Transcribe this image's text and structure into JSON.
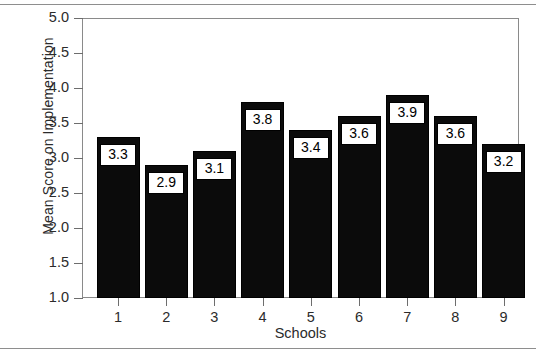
{
  "chart_data": {
    "type": "bar",
    "title": "",
    "xlabel": "Schools",
    "ylabel": "Mean Score on Implementation",
    "categories": [
      "1",
      "2",
      "3",
      "4",
      "5",
      "6",
      "7",
      "8",
      "9"
    ],
    "values": [
      3.3,
      2.9,
      3.1,
      3.8,
      3.4,
      3.6,
      3.9,
      3.6,
      3.2
    ],
    "value_labels": [
      "3.3",
      "2.9",
      "3.1",
      "3.8",
      "3.4",
      "3.6",
      "3.9",
      "3.6",
      "3.2"
    ],
    "ylim": [
      1.0,
      5.0
    ],
    "ytick_labels": [
      "5.0",
      "4.5",
      "4.0",
      "3.5",
      "3.0",
      "2.5",
      "2.0",
      "1.5",
      "1.0"
    ],
    "ytick_values": [
      5.0,
      4.5,
      4.0,
      3.5,
      3.0,
      2.5,
      2.0,
      1.5,
      1.0
    ],
    "grid": false,
    "legend": false,
    "bar_color": "#0b0b0b",
    "label_box_fill": "#ffffff",
    "label_box_border": "#000000",
    "axis_color": "#8a8a8a"
  }
}
